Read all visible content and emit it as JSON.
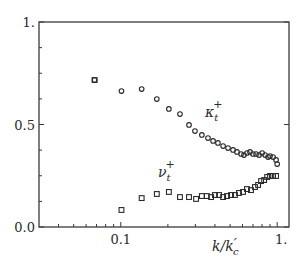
{
  "chart_data": {
    "type": "scatter",
    "title": "",
    "xlabel": "k/k'_c",
    "ylabel": "",
    "xscale": "log",
    "xlim": [
      0.03,
      1.19
    ],
    "ylim": [
      0.0,
      1.0
    ],
    "grid": false,
    "legend": "inline labels",
    "x_tick_labels": [
      "0.1",
      "1."
    ],
    "x_tick_values": [
      0.1,
      1.0
    ],
    "y_tick_labels": [
      "0.0",
      "0.5",
      "1."
    ],
    "y_tick_values": [
      0.0,
      0.5,
      1.0
    ],
    "y_minor_ticks": [
      0.125,
      0.25,
      0.375,
      0.625,
      0.75,
      0.875
    ],
    "x_minor_ticks": [
      0.04,
      0.05,
      0.06,
      0.07,
      0.08,
      0.09,
      0.2,
      0.3,
      0.4,
      0.5,
      0.6,
      0.7,
      0.8,
      0.9
    ],
    "series": [
      {
        "name": "kappa_t^+",
        "label_main": "κ",
        "label_sub": "t",
        "label_sup": "+",
        "marker": "circle",
        "label_pos": [
          205,
          117
        ],
        "x": [
          0.068,
          0.101,
          0.136,
          0.17,
          0.203,
          0.239,
          0.273,
          0.298,
          0.33,
          0.361,
          0.389,
          0.418,
          0.451,
          0.485,
          0.522,
          0.553,
          0.588,
          0.613,
          0.641,
          0.67,
          0.7,
          0.733,
          0.766,
          0.801,
          0.837,
          0.875,
          0.9,
          0.941,
          0.984,
          1.0
        ],
        "y": [
          0.717,
          0.663,
          0.673,
          0.624,
          0.576,
          0.551,
          0.498,
          0.468,
          0.449,
          0.434,
          0.42,
          0.41,
          0.395,
          0.385,
          0.376,
          0.366,
          0.356,
          0.351,
          0.361,
          0.366,
          0.356,
          0.356,
          0.351,
          0.361,
          0.351,
          0.341,
          0.346,
          0.341,
          0.327,
          0.307
        ]
      },
      {
        "name": "nu_t^+",
        "label_main": "ν",
        "label_sub": "t",
        "label_sup": "+",
        "marker": "square",
        "label_pos": [
          158,
          177
        ],
        "x": [
          0.068,
          0.101,
          0.136,
          0.17,
          0.203,
          0.239,
          0.273,
          0.303,
          0.33,
          0.355,
          0.378,
          0.4,
          0.425,
          0.451,
          0.478,
          0.507,
          0.537,
          0.57,
          0.605,
          0.641,
          0.68,
          0.721,
          0.755,
          0.789,
          0.825,
          0.863,
          0.9,
          0.941,
          0.984
        ],
        "y": [
          0.717,
          0.083,
          0.141,
          0.161,
          0.171,
          0.146,
          0.146,
          0.137,
          0.151,
          0.151,
          0.146,
          0.156,
          0.156,
          0.146,
          0.151,
          0.156,
          0.156,
          0.166,
          0.171,
          0.185,
          0.18,
          0.195,
          0.205,
          0.224,
          0.229,
          0.244,
          0.249,
          0.249,
          0.249
        ]
      }
    ]
  },
  "axes": {
    "x_label_main": "k/k",
    "x_label_prime": "′",
    "x_label_sub": "c"
  },
  "colors": {
    "ink": "#2a2a2a",
    "background": "#ffffff"
  }
}
